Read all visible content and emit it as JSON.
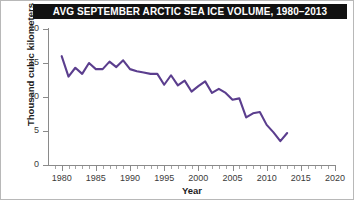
{
  "title": "AVG SEPTEMBER ARCTIC SEA ICE VOLUME, 1980–2013",
  "axis": {
    "x_title": "Year",
    "y_title": "Thousand cubic kilometers"
  },
  "colors": {
    "series_line": "#5B3E8E",
    "banner_background": "#111111",
    "banner_text": "#FFFFFF",
    "axis": "#8A8A8A",
    "tick_label": "#3B3B3B"
  },
  "chart_data": {
    "type": "line",
    "title": "AVG SEPTEMBER ARCTIC SEA ICE VOLUME, 1980–2013",
    "xlabel": "Year",
    "ylabel": "Thousand cubic kilometers",
    "xlim": [
      1978,
      2020
    ],
    "ylim": [
      0,
      20
    ],
    "xticks": [
      1980,
      1985,
      1990,
      1995,
      2000,
      2005,
      2010,
      2015,
      2020
    ],
    "yticks": [
      0,
      5,
      10,
      15,
      20
    ],
    "minor_xtick_interval": 1,
    "grid": false,
    "legend": false,
    "series": [
      {
        "name": "September Arctic sea ice volume",
        "color": "#5B3E8E",
        "x": [
          1980,
          1981,
          1982,
          1983,
          1984,
          1985,
          1986,
          1987,
          1988,
          1989,
          1990,
          1991,
          1992,
          1993,
          1994,
          1995,
          1996,
          1997,
          1998,
          1999,
          2000,
          2001,
          2002,
          2003,
          2004,
          2005,
          2006,
          2007,
          2008,
          2009,
          2010,
          2011,
          2012,
          2013
        ],
        "y": [
          16.0,
          13.0,
          14.3,
          13.4,
          15.0,
          14.1,
          14.1,
          15.2,
          14.4,
          15.4,
          14.1,
          13.8,
          13.6,
          13.4,
          13.4,
          11.8,
          13.2,
          11.7,
          12.4,
          10.8,
          11.6,
          12.3,
          10.6,
          11.2,
          10.6,
          9.6,
          9.8,
          7.0,
          7.6,
          7.8,
          5.9,
          4.8,
          3.5,
          4.7
        ]
      }
    ]
  }
}
